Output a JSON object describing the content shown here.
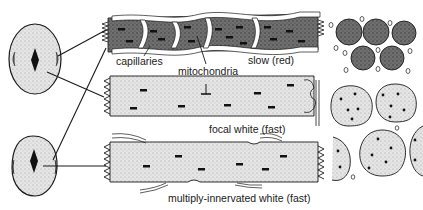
{
  "figure": {
    "colors": {
      "ink": "#1a1a1a",
      "slow_fill": "#6a6a6a",
      "fast_fill": "#d8d8d8",
      "capillary": "#ffffff",
      "background": "#ffffff"
    }
  },
  "labels": {
    "capillaries": "capillaries",
    "mitochondria": "mitochondria",
    "slow": "slow (red)",
    "focal_white": "focal white (fast)",
    "multiply_innervated": "multiply-innervated white (fast)"
  },
  "panels": {
    "left": [
      {
        "name": "upper-muscle-cross-section",
        "shape": "oval"
      },
      {
        "name": "lower-muscle-cross-section",
        "shape": "egg"
      }
    ],
    "middle": [
      {
        "name": "slow-red-fibre",
        "type": "slow (red)"
      },
      {
        "name": "focal-white-fibre",
        "type": "focal white (fast)"
      },
      {
        "name": "multiply-innervated-white-fibre",
        "type": "multiply-innervated white (fast)"
      }
    ],
    "right": [
      {
        "name": "slow-fibre-cross-sections",
        "count": 5
      },
      {
        "name": "fast-fibre-cross-sections",
        "count": 5
      }
    ]
  }
}
